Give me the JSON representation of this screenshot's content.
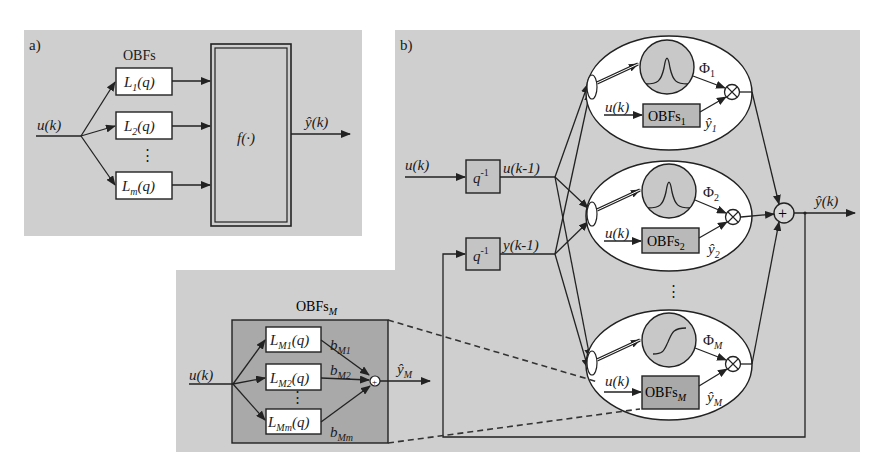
{
  "panel_a": {
    "tag": "a)",
    "group_label": "OBFs",
    "input_label": "u(k)",
    "filters": [
      {
        "name": "L",
        "sub": "1",
        "arg": "(q)"
      },
      {
        "name": "L",
        "sub": "2",
        "arg": "(q)"
      },
      {
        "name": "L",
        "sub": "m",
        "arg": "(q)"
      }
    ],
    "ellipsis": "⋮",
    "nonlinear_block": "f(·)",
    "output_label": "ŷ(k)"
  },
  "panel_b": {
    "tag": "b)",
    "inputs": [
      {
        "in_label": "u(k)",
        "delay": "q",
        "delay_exp": "-1",
        "out_label": "u(k-1)"
      },
      {
        "delay": "q",
        "delay_exp": "-1",
        "out_label": "y(k-1)"
      }
    ],
    "local_models": [
      {
        "phi": "Φ",
        "phi_sub": "1",
        "input": "u(k)",
        "obfs": "OBFs",
        "obfs_sub": "1",
        "yhat": "ŷ",
        "yhat_sub": "1",
        "activation": "gaussian"
      },
      {
        "phi": "Φ",
        "phi_sub": "2",
        "input": "u(k)",
        "obfs": "OBFs",
        "obfs_sub": "2",
        "yhat": "ŷ",
        "yhat_sub": "2",
        "activation": "gaussian"
      },
      {
        "phi": "Φ",
        "phi_sub": "M",
        "input": "u(k)",
        "obfs": "OBFs",
        "obfs_sub": "M",
        "yhat": "ŷ",
        "yhat_sub": "M",
        "activation": "sigmoid"
      }
    ],
    "ellipsis": "⋮",
    "multiply_symbol": "⊗",
    "sum_symbol": "+",
    "output_label": "ŷ(k)"
  },
  "detail": {
    "title": "OBFs",
    "title_sub": "M",
    "input_label": "u(k)",
    "filters": [
      {
        "name": "L",
        "sub": "M1",
        "arg": "(q)",
        "weight": "b",
        "weight_sub": "M1"
      },
      {
        "name": "L",
        "sub": "M2",
        "arg": "(q)",
        "weight": "b",
        "weight_sub": "M2"
      },
      {
        "name": "L",
        "sub": "Mm",
        "arg": "(q)",
        "weight": "b",
        "weight_sub": "Mm"
      }
    ],
    "ellipsis": "⋮",
    "sum_symbol": "+",
    "output_label": "ŷ",
    "output_sub": "M"
  },
  "colors": {
    "panel_bg": "#cfcfcf",
    "detail_box": "#a9a9a9",
    "obfs_box": "#b9b9b9",
    "line": "#222222"
  }
}
